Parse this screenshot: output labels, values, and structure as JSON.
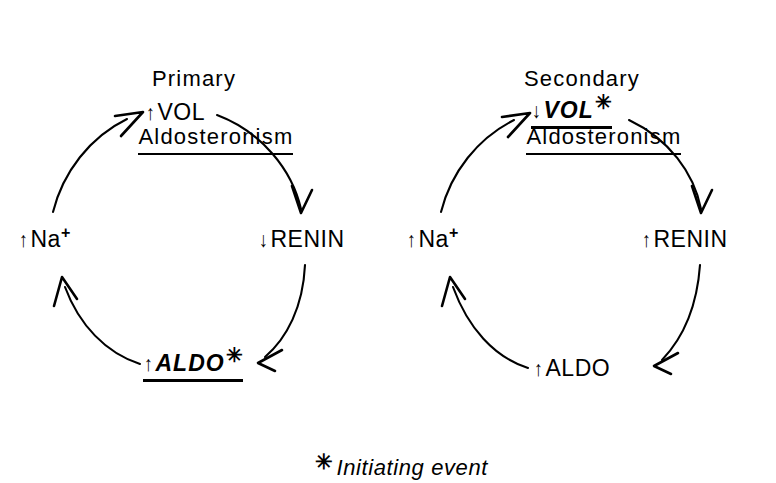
{
  "figure": {
    "caption_star": "✳",
    "caption_text": "Initiating event"
  },
  "panels": [
    {
      "id": "primary",
      "title_line1": "Primary",
      "title_line2": "Aldosteronism",
      "nodes": [
        {
          "id": "vol",
          "delta": "↑",
          "label": "VOL",
          "sup": "",
          "star": "",
          "highlight": false
        },
        {
          "id": "renin",
          "delta": "↓",
          "label": "RENIN",
          "sup": "",
          "star": "",
          "highlight": false
        },
        {
          "id": "aldo",
          "delta": "↑",
          "label": "ALDO",
          "sup": "",
          "star": "✳",
          "highlight": true
        },
        {
          "id": "na",
          "delta": "↑",
          "label": "Na",
          "sup": "+",
          "star": "",
          "highlight": false
        }
      ]
    },
    {
      "id": "secondary",
      "title_line1": "Secondary",
      "title_line2": "Aldosteronism",
      "nodes": [
        {
          "id": "vol",
          "delta": "↓",
          "label": "VOL",
          "sup": "",
          "star": "✳",
          "highlight": true
        },
        {
          "id": "renin",
          "delta": "↑",
          "label": "RENIN",
          "sup": "",
          "star": "",
          "highlight": false
        },
        {
          "id": "aldo",
          "delta": "↑",
          "label": "ALDO",
          "sup": "",
          "star": "",
          "highlight": false
        },
        {
          "id": "na",
          "delta": "↑",
          "label": "Na",
          "sup": "+",
          "star": "",
          "highlight": false
        }
      ]
    }
  ],
  "colors": {
    "ink": "#000000",
    "background": "#ffffff"
  }
}
